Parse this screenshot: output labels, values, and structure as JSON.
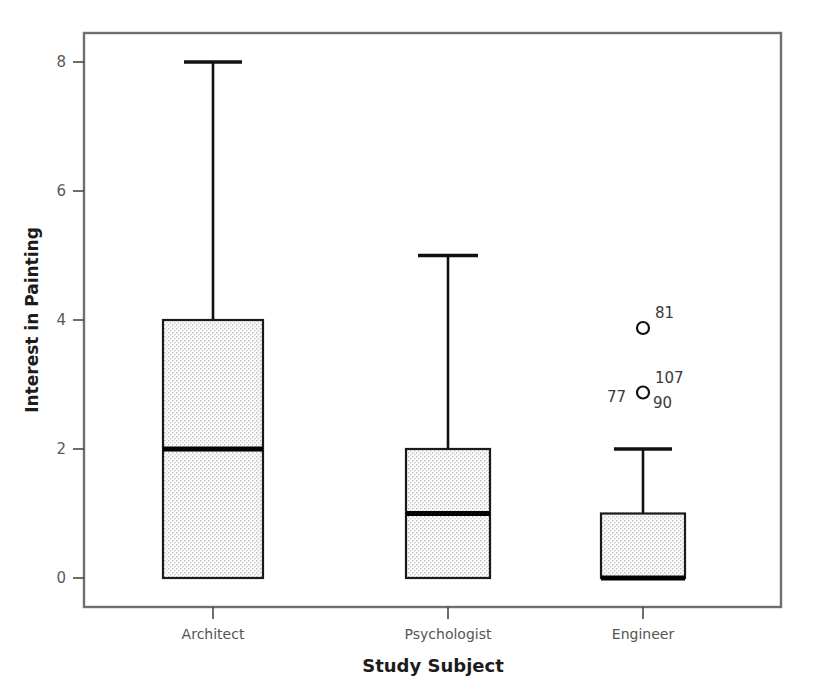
{
  "chart_data": {
    "type": "box",
    "title": "",
    "xlabel": "Study Subject",
    "ylabel": "Interest in Painting",
    "categories": [
      "Architect",
      "Psychologist",
      "Engineer"
    ],
    "ylim": [
      -0.25,
      8.6
    ],
    "yticks": [
      0,
      2,
      4,
      6,
      8
    ],
    "ytick_labels": [
      "0",
      "2",
      "4",
      "6",
      "8"
    ],
    "grid": false,
    "legend": "none",
    "boxes": [
      {
        "category": "Architect",
        "whisker_low": 0,
        "q1": 0,
        "median": 2,
        "q3": 4,
        "whisker_high": 8,
        "outliers": []
      },
      {
        "category": "Psychologist",
        "whisker_low": 0,
        "q1": 0,
        "median": 1,
        "q3": 2,
        "whisker_high": 5,
        "outliers": []
      },
      {
        "category": "Engineer",
        "whisker_low": 0,
        "q1": 0,
        "median": 0,
        "q3": 1,
        "whisker_high": 2,
        "outliers": [
          {
            "value": 4,
            "case_labels": [
              "81"
            ]
          },
          {
            "value": 3,
            "case_labels": [
              "107",
              "77",
              "90"
            ]
          }
        ]
      }
    ],
    "outlier_annotations": [
      {
        "text": "81",
        "value": 4,
        "position": "upper-right"
      },
      {
        "text": "107",
        "value": 3,
        "position": "upper-right"
      },
      {
        "text": "77",
        "value": 3,
        "position": "left"
      },
      {
        "text": "90",
        "value": 3,
        "position": "lower-right"
      }
    ],
    "colors": {
      "box_fill": "#f2f2f2",
      "box_stroke": "#1a1a1a",
      "frame": "#6f6f6f",
      "text": "#3a3a3a",
      "axis_title": "#1c1c1c"
    }
  }
}
